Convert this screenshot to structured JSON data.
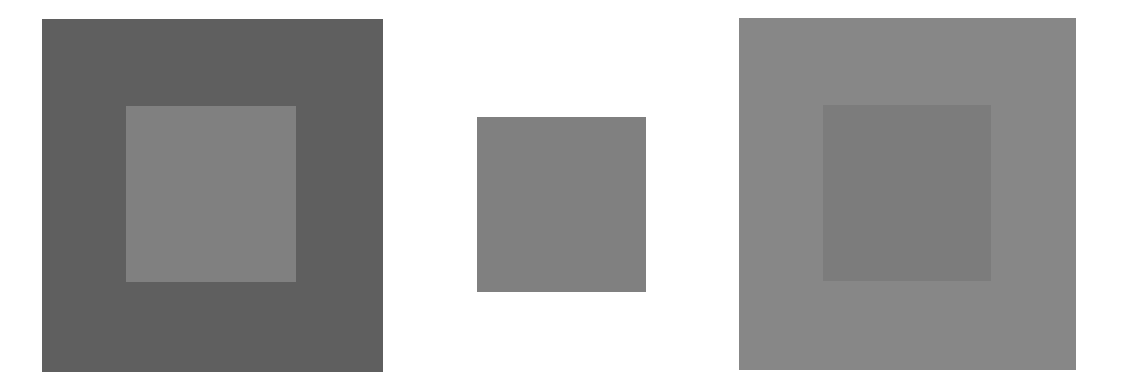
{
  "figure": {
    "type": "simultaneous-contrast-illusion",
    "background": "#ffffff",
    "panels": [
      {
        "id": "left",
        "outer": {
          "x": 42,
          "y": 19,
          "w": 341,
          "h": 353,
          "color": "#5f5f5f"
        },
        "inner": {
          "x": 126,
          "y": 106,
          "w": 170,
          "h": 176,
          "color": "#808080"
        }
      },
      {
        "id": "center",
        "outer": null,
        "inner": {
          "x": 477,
          "y": 117,
          "w": 169,
          "h": 175,
          "color": "#808080"
        }
      },
      {
        "id": "right",
        "outer": {
          "x": 739,
          "y": 18,
          "w": 337,
          "h": 352,
          "color": "#878787"
        },
        "inner": {
          "x": 823,
          "y": 105,
          "w": 168,
          "h": 176,
          "color": "#7c7c7c"
        }
      }
    ]
  }
}
